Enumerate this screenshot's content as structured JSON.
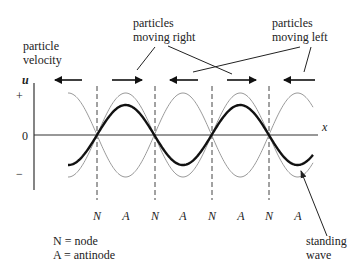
{
  "diagram": {
    "labels": {
      "particle_velocity_line1": "particle",
      "particle_velocity_line2": "velocity",
      "moving_right_line1": "particles",
      "moving_right_line2": "moving right",
      "moving_left_line1": "particles",
      "moving_left_line2": "moving left",
      "standing_wave_line1": "standing",
      "standing_wave_line2": "wave"
    },
    "axes": {
      "y_label": "u",
      "x_label": "x",
      "y_ticks": {
        "plus": "+",
        "zero": "0",
        "minus": "−"
      }
    },
    "node_labels": [
      "N",
      "A",
      "N",
      "A",
      "N",
      "A",
      "N",
      "A"
    ],
    "legend": {
      "node": "N = node",
      "antinode": "A = antinode"
    },
    "arrows": [
      {
        "direction": "left"
      },
      {
        "direction": "right"
      },
      {
        "direction": "left"
      },
      {
        "direction": "right"
      },
      {
        "direction": "left"
      }
    ],
    "colors": {
      "bold_wave": "#111111",
      "envelope": "#9a9a9a",
      "axis": "#333333",
      "text": "#222222"
    },
    "wave": {
      "center_y": 135,
      "node_x": [
        97,
        155,
        212,
        269
      ],
      "half_wavelength_px": 57.3,
      "bold_amplitude_px": 30,
      "envelope_amplitude_px": 42,
      "x_start": 68,
      "x_end": 313
    }
  }
}
